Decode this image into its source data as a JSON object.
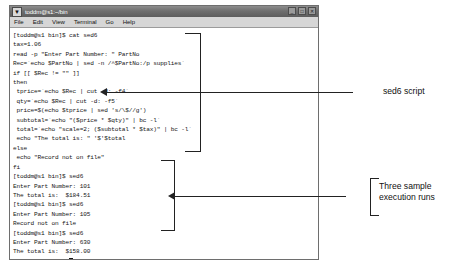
{
  "window": {
    "title": "toddm@s1:~/bin",
    "menu_icon": "window-menu-icon",
    "controls": [
      {
        "name": "minimize",
        "glyph": "_"
      },
      {
        "name": "maximize",
        "glyph": "□"
      },
      {
        "name": "close",
        "glyph": "✕"
      }
    ],
    "menus": [
      "File",
      "Edit",
      "View",
      "Terminal",
      "Go",
      "Help"
    ]
  },
  "terminal": {
    "lines": [
      "[toddm@s1 bin]$ cat sed6",
      "tax=1.06",
      "read -p \"Enter Part Number: \" PartNo",
      "Rec=`echo $PartNo | sed -n /^$PartNo:/p supplies`",
      "if [[ $Rec != \"\" ]]",
      "then",
      " tprice=`echo $Rec | cut -d: -f4`",
      " qty=`echo $Rec | cut -d: -f5`",
      " price=$(echo $tprice | sed 's/\\$//g')",
      " subtotal=`echo \"($price * $qty)\" | bc -l`",
      " total=`echo \"scale=2; ($subtotal * $tax)\" | bc -l`",
      " echo \"The total is: \" '$'$total",
      "else",
      " echo \"Record not on file\"",
      "fi",
      "[toddm@s1 bin]$ sed6",
      "Enter Part Number: 101",
      "The total is:  $184.51",
      "[toddm@s1 bin]$ sed6",
      "Enter Part Number: 105",
      "Record not on file",
      "[toddm@s1 bin]$ sed6",
      "Enter Part Number: 630",
      "The total is:  $158.00",
      "[toddm@s1 bin]$ "
    ],
    "prompt_cursor": true
  },
  "annotations": {
    "script_label": "sed6 script",
    "runs_label": "Three sample\nexecution runs"
  },
  "colors": {
    "titlebar": "#6f6f6f",
    "menubar": "#d6d6d6",
    "terminal_bg": "#ffffff",
    "terminal_text": "#151515",
    "annotation": "#222222"
  }
}
